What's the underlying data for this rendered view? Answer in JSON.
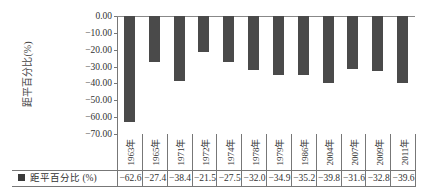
{
  "chart_data": {
    "type": "bar",
    "title": "",
    "xlabel": "",
    "ylabel": "距平百分比(%)",
    "ylim": [
      -70,
      0
    ],
    "yticks": [
      "0.00",
      "-10.00",
      "-20.00",
      "-30.00",
      "-40.00",
      "-50.00",
      "-60.00",
      "-70.00"
    ],
    "categories": [
      "1963年",
      "1965年",
      "1971年",
      "1972年",
      "1974年",
      "1978年",
      "1979年",
      "1986年",
      "2004年",
      "2007年",
      "2009年",
      "2011年"
    ],
    "series": [
      {
        "name": "距平百分比 (%)",
        "color": "#4a4a4a",
        "values": [
          -62.6,
          -27.4,
          -38.4,
          -21.5,
          -27.5,
          -32.0,
          -34.9,
          -35.2,
          -39.8,
          -31.6,
          -32.8,
          -39.6
        ]
      }
    ],
    "value_labels": [
      "-62.6",
      "-27.4",
      "-38.4",
      "-21.5",
      "-27.5",
      "-32.0",
      "-34.9",
      "-35.2",
      "-39.8",
      "-31.6",
      "-32.8",
      "-39.6"
    ],
    "grid": false,
    "legend_position": "data-table-bottom"
  }
}
